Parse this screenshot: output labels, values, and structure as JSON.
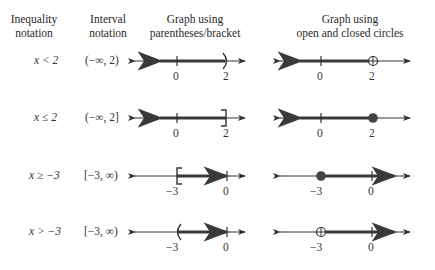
{
  "headers": {
    "inequality": [
      "Inequality",
      "notation"
    ],
    "interval": [
      "Interval",
      "notation"
    ],
    "paren_graph": [
      "Graph using",
      "parentheses/bracket"
    ],
    "circle_graph": [
      "Graph using",
      "open and closed circles"
    ]
  },
  "rows": [
    {
      "inequality": "x < 2",
      "interval": "(−∞, 2)",
      "paren_graph": {
        "endpoint": 2,
        "symbol": ")",
        "direction": "left",
        "ticks": [
          "0",
          "2"
        ]
      },
      "circle_graph": {
        "endpoint": 2,
        "circle": "open",
        "direction": "left",
        "ticks": [
          "0",
          "2"
        ]
      }
    },
    {
      "inequality": "x ≤ 2",
      "interval": "(−∞, 2]",
      "paren_graph": {
        "endpoint": 2,
        "symbol": "]",
        "direction": "left",
        "ticks": [
          "0",
          "2"
        ]
      },
      "circle_graph": {
        "endpoint": 2,
        "circle": "closed",
        "direction": "left",
        "ticks": [
          "0",
          "2"
        ]
      }
    },
    {
      "inequality": "x ≥ −3",
      "interval": "[−3, ∞)",
      "paren_graph": {
        "endpoint": -3,
        "symbol": "[",
        "direction": "right",
        "ticks": [
          "−3",
          "0"
        ]
      },
      "circle_graph": {
        "endpoint": -3,
        "circle": "closed",
        "direction": "right",
        "ticks": [
          "−3",
          "0"
        ]
      }
    },
    {
      "inequality": "x > −3",
      "interval": "[−3, ∞)",
      "paren_graph": {
        "endpoint": -3,
        "symbol": "(",
        "direction": "right",
        "ticks": [
          "−3",
          "0"
        ]
      },
      "circle_graph": {
        "endpoint": -3,
        "circle": "open",
        "direction": "right",
        "ticks": [
          "−3",
          "0"
        ]
      }
    }
  ],
  "colors": {
    "axis": "#333333",
    "shade": "#3a3a3a",
    "text": "#333333"
  }
}
